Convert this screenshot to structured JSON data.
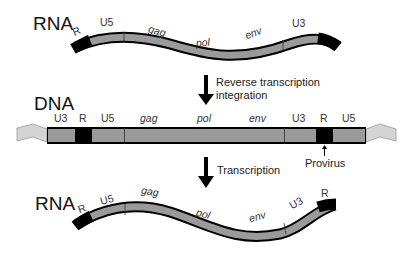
{
  "colors": {
    "segment_fill": "#9a9a9a",
    "ltr_r_fill": "#000000",
    "host_dna_fill": "#d4d4d4",
    "outline": "#000000",
    "text": "#222222"
  },
  "top_rna": {
    "label": "RNA",
    "segments": [
      "R",
      "U5",
      "gag",
      "pol",
      "env",
      "U3"
    ]
  },
  "step1": {
    "arrow": "down-arrow",
    "label_line1": "Reverse transcription",
    "label_line2": "integration"
  },
  "dna": {
    "label": "DNA",
    "segments": [
      "U3",
      "R",
      "U5",
      "gag",
      "pol",
      "env",
      "U3",
      "R",
      "U5"
    ],
    "provirus_label": "Provirus"
  },
  "step2": {
    "arrow": "down-arrow",
    "label": "Transcription"
  },
  "bottom_rna": {
    "label": "RNA",
    "segments": [
      "R",
      "U5",
      "gag",
      "pol",
      "env",
      "U3",
      "R"
    ]
  }
}
